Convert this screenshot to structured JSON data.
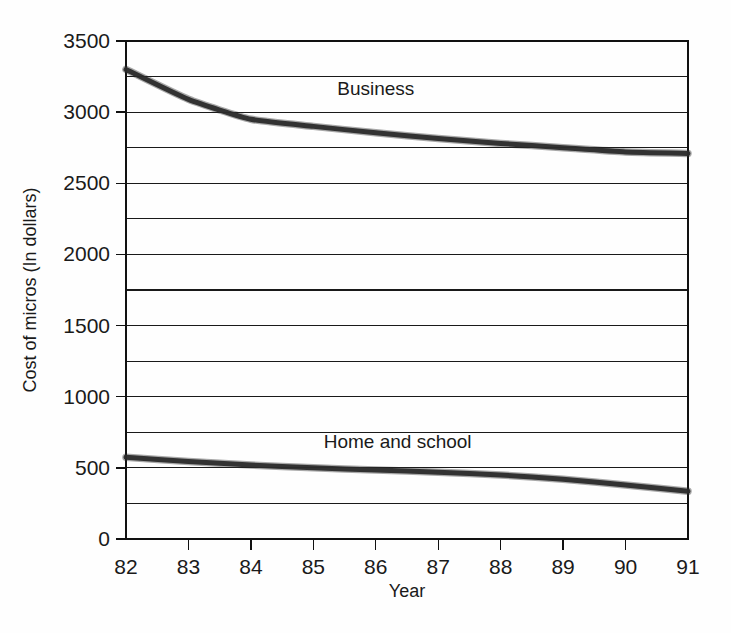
{
  "chart_data": {
    "type": "line",
    "title": "",
    "xlabel": "Year",
    "ylabel": "Cost of micros (In dollars)",
    "x": [
      82,
      83,
      84,
      85,
      86,
      87,
      88,
      89,
      90,
      91
    ],
    "xtick_labels": [
      "82",
      "83",
      "84",
      "85",
      "86",
      "87",
      "88",
      "89",
      "90",
      "91"
    ],
    "xlim": [
      82,
      91
    ],
    "ylim": [
      0,
      3500
    ],
    "ytick_labels": [
      "0",
      "500",
      "1000",
      "1500",
      "2000",
      "2500",
      "3000",
      "3500"
    ],
    "ytick_values": [
      0,
      500,
      1000,
      1500,
      2000,
      2500,
      3000,
      3500
    ],
    "gridline_values": [
      0,
      250,
      500,
      750,
      1000,
      1250,
      1500,
      1750,
      2000,
      2250,
      2500,
      2750,
      3000,
      3250,
      3500
    ],
    "grid": true,
    "legend_position": "inline",
    "series": [
      {
        "name": "Business",
        "values": [
          3300,
          3090,
          2950,
          2900,
          2855,
          2815,
          2780,
          2750,
          2720,
          2710
        ],
        "label_x": 86.0,
        "label_y": 3120
      },
      {
        "name": "Home and school",
        "values": [
          575,
          545,
          520,
          500,
          485,
          470,
          450,
          420,
          380,
          335
        ],
        "label_x": 86.35,
        "label_y": 640
      }
    ]
  },
  "layout": {
    "plot_left": 126,
    "plot_right": 688,
    "plot_top": 41,
    "plot_bottom": 539,
    "colors": {
      "line": "#2b2b2b",
      "grid": "#1a1a1a",
      "frame": "#111111",
      "text": "#1a1a1a",
      "background": "#fefefe"
    }
  }
}
